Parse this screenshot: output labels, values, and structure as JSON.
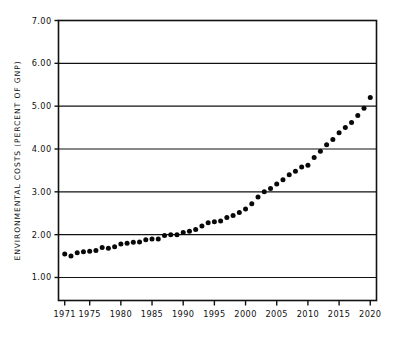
{
  "chart_data": {
    "type": "scatter",
    "title": "",
    "xlabel": "",
    "ylabel": "ENVIRONMENTAL COSTS (PERCENT OF GNP)",
    "xlim": [
      1970,
      2021
    ],
    "ylim": [
      0.5,
      7.0
    ],
    "grid": true,
    "legend": null,
    "y_ticks": [
      "7.00",
      "6.00",
      "5.00",
      "4.00",
      "3.00",
      "2.00",
      "1.00"
    ],
    "y_tick_values": [
      7.0,
      6.0,
      5.0,
      4.0,
      3.0,
      2.0,
      1.0
    ],
    "x_ticks": [
      "1971",
      "1975",
      "1980",
      "1985",
      "1990",
      "1995",
      "2000",
      "2005",
      "2010",
      "2015",
      "2020"
    ],
    "x_tick_values": [
      1971,
      1975,
      1980,
      1985,
      1990,
      1995,
      2000,
      2005,
      2010,
      2015,
      2020
    ],
    "marker": "filled-circle",
    "marker_color": "#080808",
    "x": [
      1971,
      1972,
      1973,
      1974,
      1975,
      1976,
      1977,
      1978,
      1979,
      1980,
      1981,
      1982,
      1983,
      1984,
      1985,
      1986,
      1987,
      1988,
      1989,
      1990,
      1991,
      1992,
      1993,
      1994,
      1995,
      1996,
      1997,
      1998,
      1999,
      2000,
      2001,
      2002,
      2003,
      2004,
      2005,
      2006,
      2007,
      2008,
      2009,
      2010,
      2011,
      2012,
      2013,
      2014,
      2015,
      2016,
      2017,
      2018,
      2019,
      2020
    ],
    "values": [
      1.55,
      1.5,
      1.58,
      1.6,
      1.61,
      1.63,
      1.7,
      1.68,
      1.72,
      1.78,
      1.8,
      1.82,
      1.83,
      1.88,
      1.9,
      1.9,
      1.98,
      2.0,
      2.0,
      2.05,
      2.08,
      2.12,
      2.2,
      2.28,
      2.3,
      2.32,
      2.4,
      2.45,
      2.52,
      2.6,
      2.72,
      2.88,
      3.0,
      3.08,
      3.18,
      3.28,
      3.4,
      3.48,
      3.58,
      3.62,
      3.8,
      3.95,
      4.1,
      4.22,
      4.38,
      4.5,
      4.62,
      4.78,
      4.95,
      5.2
    ]
  },
  "figure": {
    "ylabel": "ENVIRONMENTAL COSTS (PERCENT OF GNP)"
  }
}
